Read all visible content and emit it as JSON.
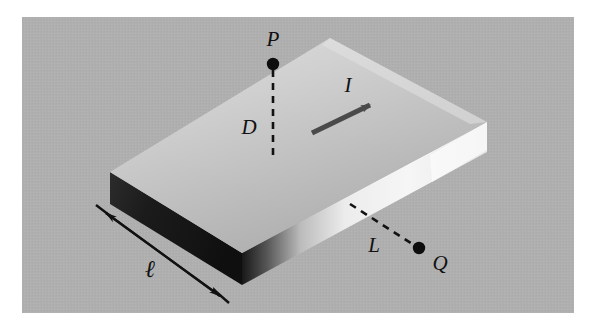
{
  "figure": {
    "type": "physics-diagram",
    "background_color": "#b0b0b0",
    "page_color": "#ffffff",
    "canvas": {
      "width": 596,
      "height": 320
    },
    "plate_region": {
      "x": 22,
      "y": 17,
      "width": 552,
      "height": 296
    }
  },
  "labels": {
    "point_p": "P",
    "point_q": "Q",
    "distance_d": "D",
    "distance_l": "L",
    "current": "I",
    "length_ell": "ℓ"
  },
  "colors": {
    "background": "#b0b0b0",
    "slab_top_light": "#d9d9d9",
    "slab_top_dark": "#a8a8a8",
    "slab_front_dark": "#1d1d1d",
    "slab_front_light": "#f2f2f2",
    "ink": "#111111",
    "arrow": "#4a4a4a"
  },
  "geometry": {
    "slab_top_face": "110,172 330,38 487,122 242,253",
    "slab_front_face": "110,172 242,253 242,285 110,204",
    "slab_right_face": "242,253 487,122 487,152 242,285",
    "point_p": {
      "x": 273,
      "y": 64,
      "r": 6
    },
    "point_q": {
      "x": 419,
      "y": 248,
      "r": 6
    },
    "dashed_d": {
      "x1": 273,
      "y1": 70,
      "x2": 273,
      "y2": 155
    },
    "dashed_l": {
      "x1": 350,
      "y1": 204,
      "x2": 414,
      "y2": 245
    },
    "current_arrow": {
      "x1": 312,
      "y1": 133,
      "x2": 374,
      "y2": 103
    },
    "dimension_ell": {
      "x1": 104,
      "y1": 212,
      "x2": 220,
      "y2": 296
    }
  },
  "label_positions": {
    "point_p": {
      "x": 273,
      "y": 46
    },
    "distance_d": {
      "x": 249,
      "y": 134
    },
    "current": {
      "x": 348,
      "y": 92
    },
    "distance_l": {
      "x": 374,
      "y": 250
    },
    "point_q": {
      "x": 440,
      "y": 268
    },
    "length_ell": {
      "x": 150,
      "y": 274
    }
  }
}
